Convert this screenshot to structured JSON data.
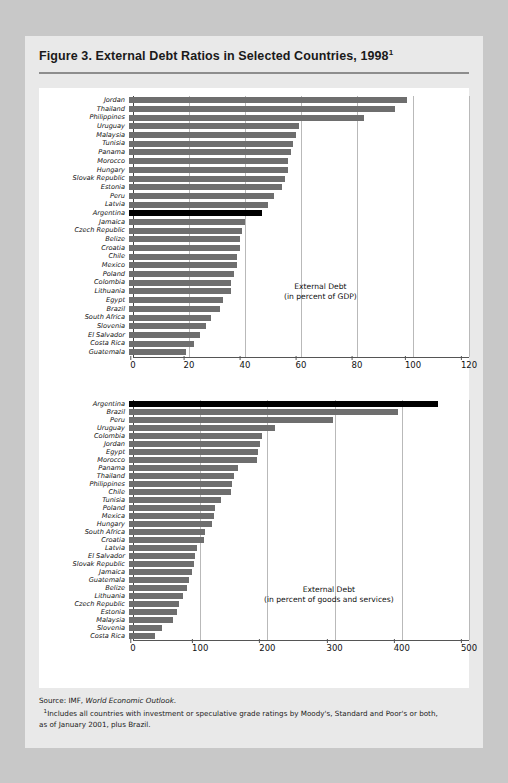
{
  "figure": {
    "title": "Figure 3. External Debt Ratios in Selected Countries, 1998",
    "title_superscript": "1",
    "source_prefix": "Source: IMF, ",
    "source_italic": "World Economic Outlook",
    "source_suffix": ".",
    "footnote_marker": "1",
    "footnote_line1": "Includes all countries with investment or speculative grade ratings by Moody's, Standard and Poor's or both,",
    "footnote_line2": "as of January 2001, plus Brazil."
  },
  "colors": {
    "bar": "#6e6e6e",
    "highlight": "#000000",
    "card_bg": "#e9e9e9",
    "page_bg": "#c8c8c8",
    "plot_bg": "#ffffff",
    "gridline": "#b9b9b9"
  },
  "chart_data": [
    {
      "id": "top",
      "type": "bar",
      "orientation": "horizontal",
      "title": "External Debt",
      "subtitle": "(in percent of GDP)",
      "xlabel": "",
      "ylabel": "",
      "xlim": [
        0,
        120
      ],
      "xticks": [
        0,
        20,
        40,
        60,
        80,
        100,
        120
      ],
      "grid": true,
      "legend": "none",
      "highlight_category": "Argentina",
      "categories": [
        "Jordan",
        "Thailand",
        "Philippines",
        "Uruguay",
        "Malaysia",
        "Tunisia",
        "Panama",
        "Morocco",
        "Hungary",
        "Slovak Republic",
        "Estonia",
        "Peru",
        "Latvia",
        "Argentina",
        "Jamaica",
        "Czech Republic",
        "Belize",
        "Croatia",
        "Chile",
        "Mexico",
        "Poland",
        "Colombia",
        "Lithuania",
        "Egypt",
        "Brazil",
        "South Africa",
        "Slovenia",
        "El Salvador",
        "Costa Rica",
        "Guatemala"
      ],
      "values": [
        98,
        94,
        83,
        60,
        59,
        58,
        57,
        56,
        56,
        55,
        54,
        51,
        49,
        47,
        41,
        40,
        39,
        39,
        38,
        38,
        37,
        36,
        36,
        33,
        32,
        29,
        27,
        25,
        23,
        20
      ]
    },
    {
      "id": "bottom",
      "type": "bar",
      "orientation": "horizontal",
      "title": "External Debt",
      "subtitle": "(in percent of goods and services)",
      "xlabel": "",
      "ylabel": "",
      "xlim": [
        0,
        500
      ],
      "xticks": [
        0,
        100,
        200,
        300,
        400,
        500
      ],
      "grid": true,
      "legend": "none",
      "highlight_category": "Argentina",
      "categories": [
        "Argentina",
        "Brazil",
        "Peru",
        "Uruguay",
        "Colombia",
        "Jordan",
        "Egypt",
        "Morocco",
        "Panama",
        "Thailand",
        "Philippines",
        "Chile",
        "Tunisia",
        "Poland",
        "Mexica",
        "Hungary",
        "South Africa",
        "Croatia",
        "Latvia",
        "El Salvador",
        "Slovak Republic",
        "Jamaica",
        "Guatemala",
        "Belize",
        "Lithuania",
        "Czech Republic",
        "Estonia",
        "Malaysia",
        "Slovenia",
        "Costa Rica"
      ],
      "values": [
        455,
        395,
        300,
        215,
        195,
        193,
        190,
        188,
        160,
        155,
        152,
        150,
        135,
        127,
        125,
        122,
        112,
        110,
        100,
        97,
        95,
        92,
        88,
        85,
        80,
        73,
        70,
        65,
        48,
        38
      ]
    }
  ]
}
